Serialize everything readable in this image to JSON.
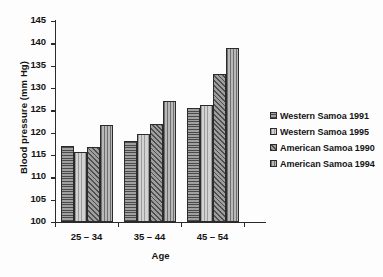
{
  "chart_data": {
    "type": "bar",
    "title": "",
    "xlabel": "Age",
    "ylabel": "Blood pressure (mm Hg)",
    "categories": [
      "25 – 34",
      "35 – 44",
      "45 – 54"
    ],
    "series": [
      {
        "name": "Western Samoa 1991",
        "values": [
          117.0,
          118.2,
          125.5
        ],
        "pattern": "horizontal-hatch"
      },
      {
        "name": "Western Samoa 1995",
        "values": [
          115.7,
          119.7,
          126.1
        ],
        "pattern": "light-vertical-hatch"
      },
      {
        "name": "American Samoa 1990",
        "values": [
          116.7,
          122.0,
          133.2
        ],
        "pattern": "diagonal-hatch"
      },
      {
        "name": "American Samoa 1994",
        "values": [
          121.7,
          127.0,
          139.0
        ],
        "pattern": "vertical-hatch"
      }
    ],
    "ylim": [
      100,
      145
    ],
    "yticks": [
      100,
      105,
      110,
      115,
      120,
      125,
      130,
      135,
      140,
      145
    ],
    "ytick_labels": [
      "100",
      "105",
      "110",
      "115",
      "120",
      "125",
      "130",
      "135",
      "140",
      "145"
    ],
    "grid": false,
    "legend_position": "right",
    "colors": {
      "axis": "#2a2a2a",
      "text": "#141414",
      "series_fill_1": "#8c8c8c",
      "series_fill_2": "#c6c6c6",
      "series_fill_3": "#8a8a8a",
      "series_fill_4": "#a8a8a8"
    }
  }
}
